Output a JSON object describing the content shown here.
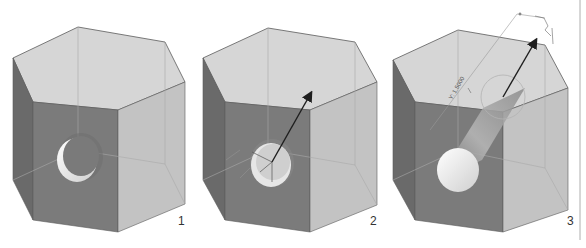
{
  "figure": {
    "colors": {
      "background": "#ffffff",
      "top_face": "#d6d6d6",
      "front_face": "#7b7b7b",
      "left_face": "#6a6a6a",
      "right_face": "#c3c3c3",
      "edge": "#5a5a5a",
      "hidden_edge": "#a9a9a9",
      "hole_inner": "#f4f4f4",
      "hole_shadow": "#6f6f6f",
      "arrow": "#1e1e1e",
      "label": "#333333",
      "divider": "#9a9a9a"
    },
    "panels": [
      {
        "id": "step-1",
        "label": "1",
        "caption": "Hexagonal prism with circular hole"
      },
      {
        "id": "step-2",
        "label": "2",
        "caption": "Hole face selected with direction arrow and triad"
      },
      {
        "id": "step-3",
        "label": "3",
        "caption": "Hole extruded as cylinder along arrow",
        "dimension_text": "Y: 1.5000"
      }
    ]
  }
}
